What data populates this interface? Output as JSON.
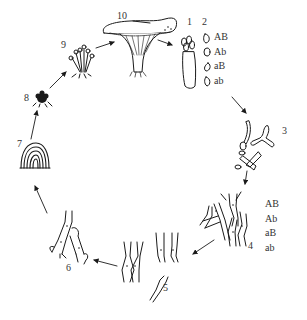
{
  "diagram": {
    "type": "life-cycle",
    "stages": [
      {
        "id": 1,
        "label": "1",
        "description": "basidium bearing four basidiospores"
      },
      {
        "id": 2,
        "label": "2",
        "description": "four basidiospores",
        "genotypes": [
          "AB",
          "Ab",
          "aB",
          "ab"
        ]
      },
      {
        "id": 3,
        "label": "3",
        "description": "germinating spores"
      },
      {
        "id": 4,
        "label": "4",
        "description": "primary (monokaryotic) hyphae",
        "genotypes": [
          "AB",
          "Ab",
          "aB",
          "ab"
        ]
      },
      {
        "id": 5,
        "label": "5",
        "description": "hyphal fusion (plasmogamy)"
      },
      {
        "id": 6,
        "label": "6",
        "description": "secondary (dikaryotic) hyphae with clamp connections"
      },
      {
        "id": 7,
        "label": "7",
        "description": "mycelial growth"
      },
      {
        "id": 8,
        "label": "8",
        "description": "primordium / hyphal knot"
      },
      {
        "id": 9,
        "label": "9",
        "description": "young fruiting bodies"
      },
      {
        "id": 10,
        "label": "10",
        "description": "mature fruiting body (mushroom)"
      }
    ],
    "flow": "clockwise",
    "stroke_color": "#1a1a1a"
  }
}
